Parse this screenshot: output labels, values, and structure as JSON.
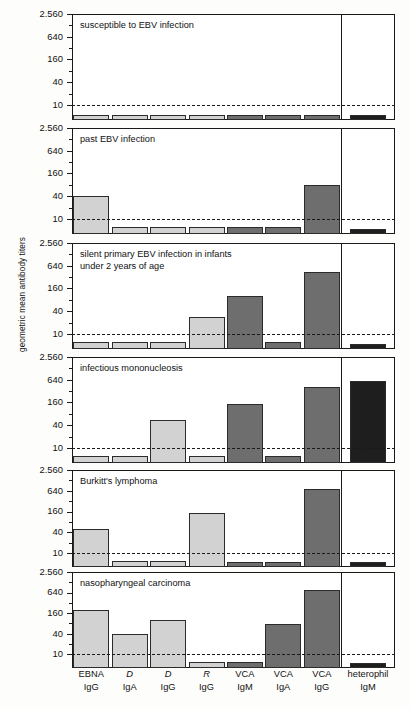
{
  "chart_data": {
    "type": "bar",
    "title": "",
    "ylabel": "geometric mean antibody titers",
    "xlabel": "",
    "scale": "log",
    "ylim": [
      4,
      2560
    ],
    "yticks": [
      10,
      40,
      160,
      640,
      2560
    ],
    "ytick_labels": [
      "10",
      "40",
      "160",
      "640",
      "2.560"
    ],
    "cutoff_value": 10,
    "cutoff_style": "dashed",
    "grid": false,
    "legend": "none",
    "categories": [
      {
        "antigen": "EBNA",
        "isotype": "IgG",
        "italic": false
      },
      {
        "antigen": "D",
        "isotype": "IgA",
        "italic": true
      },
      {
        "antigen": "D",
        "isotype": "IgG",
        "italic": true
      },
      {
        "antigen": "R",
        "isotype": "IgG",
        "italic": true
      },
      {
        "antigen": "VCA",
        "isotype": "IgM",
        "italic": false
      },
      {
        "antigen": "VCA",
        "isotype": "IgA",
        "italic": false
      },
      {
        "antigen": "VCA",
        "isotype": "IgG",
        "italic": false
      },
      {
        "antigen": "heterophil",
        "isotype": "IgM",
        "italic": false
      }
    ],
    "panels": [
      {
        "label": "susceptible to EBV infection",
        "values": [
          5,
          5,
          5,
          5,
          5,
          5,
          5,
          5
        ]
      },
      {
        "label": "past EBV infection",
        "values": [
          40,
          6,
          6,
          6,
          6,
          6,
          80,
          5
        ]
      },
      {
        "label": "silent primary EBV infection in infants\nunder 2 years of age",
        "values": [
          6,
          6,
          6,
          28,
          100,
          6,
          450,
          5
        ]
      },
      {
        "label": "infectious mononucleosis",
        "values": [
          6,
          6,
          55,
          6,
          150,
          6,
          400,
          600
        ]
      },
      {
        "label": "Burkitt's lymphoma",
        "values": [
          50,
          6,
          6,
          150,
          5,
          5,
          700,
          5
        ]
      },
      {
        "label": "nasopharyngeal carcinoma",
        "values": [
          200,
          40,
          100,
          6,
          6,
          80,
          750,
          5
        ]
      }
    ],
    "bar_colors": {
      "light": "#d2d2d2",
      "mid": "#b0b0b0",
      "dark": "#6e6e6e",
      "darkest": "#1e1e1e"
    }
  }
}
